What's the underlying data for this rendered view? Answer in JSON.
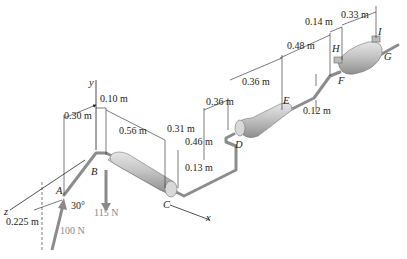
{
  "diagram": {
    "axes": {
      "x": "x",
      "y": "y",
      "z": "z"
    },
    "points": {
      "A": "A",
      "B": "B",
      "C": "C",
      "D": "D",
      "E": "E",
      "F": "F",
      "G": "G",
      "H": "H",
      "I": "I"
    },
    "dimensions": {
      "d_030": "0.30 m",
      "d_010": "0.10 m",
      "d_056": "0.56 m",
      "d_031": "0.31 m",
      "d_046": "0.46 m",
      "d_013": "0.13 m",
      "d_036a": "0.36 m",
      "d_036b": "0.36 m",
      "d_048": "0.48 m",
      "d_014": "0.14 m",
      "d_033": "0.33 m",
      "d_012": "0.12 m",
      "d_0225": "0.225 m"
    },
    "forces": {
      "weight": "115 N",
      "applied": "100 N",
      "angle": "30°"
    },
    "colors": {
      "pipe": "#9a9a9a",
      "muffler": "#c8c8c8",
      "force_arrow": "#8a8a8a",
      "line": "#222222"
    }
  }
}
